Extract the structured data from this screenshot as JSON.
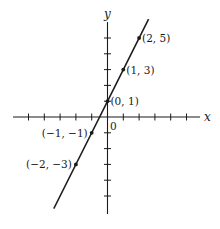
{
  "chart_data": {
    "type": "line",
    "title": "",
    "xlabel": "x",
    "ylabel": "y",
    "origin_label": "0",
    "equation": "y = 2x + 1",
    "xlim": [
      -5,
      6
    ],
    "ylim": [
      -6,
      6
    ],
    "grid": false,
    "x_ticks": [
      -5,
      -4,
      -3,
      -2,
      -1,
      1,
      2,
      3,
      4,
      5
    ],
    "y_ticks": [
      -5,
      -4,
      -3,
      -2,
      -1,
      1,
      2,
      3,
      4,
      5
    ],
    "series": [
      {
        "name": "line",
        "x": [
          -3.4,
          2.6
        ],
        "y": [
          -5.8,
          6.2
        ]
      }
    ],
    "points": [
      {
        "x": 2,
        "y": 5,
        "label": "(2, 5)",
        "label_side": "right"
      },
      {
        "x": 1,
        "y": 3,
        "label": "(1, 3)",
        "label_side": "right"
      },
      {
        "x": 0,
        "y": 1,
        "label": "(0, 1)",
        "label_side": "right"
      },
      {
        "x": -1,
        "y": -1,
        "label": "(−1, −1)",
        "label_side": "left"
      },
      {
        "x": -2,
        "y": -3,
        "label": "(−2, −3)",
        "label_side": "left"
      }
    ],
    "colors": {
      "ink": "#1a1a1a",
      "background": "#ffffff"
    }
  }
}
